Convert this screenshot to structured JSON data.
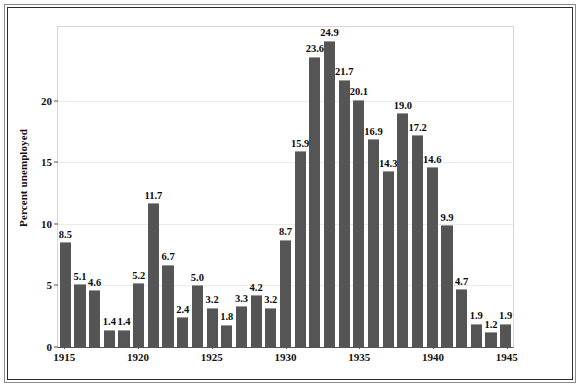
{
  "chart_data": {
    "type": "bar",
    "title": "",
    "subtitle": "",
    "xlabel": "",
    "ylabel": "Percent unemployed",
    "ylim": [
      0,
      26
    ],
    "yticks": [
      0,
      5,
      10,
      15,
      20
    ],
    "ytick_labels": [
      "0",
      "5",
      "10",
      "15",
      "20"
    ],
    "xticks": [
      1915,
      1920,
      1925,
      1930,
      1935,
      1940,
      1945
    ],
    "xtick_labels": [
      "1915",
      "1920",
      "1925",
      "1930",
      "1935",
      "1940",
      "1945"
    ],
    "grid": true,
    "grid_axis": "y",
    "legend": false,
    "legend_position": "none",
    "bar_color": "#555555",
    "data_labels": true,
    "categories": [
      "1915",
      "1916",
      "1917",
      "1918",
      "1919",
      "1920",
      "1921",
      "1922",
      "1923",
      "1924",
      "1925",
      "1926",
      "1927",
      "1928",
      "1929",
      "1930",
      "1931",
      "1932",
      "1933",
      "1934",
      "1935",
      "1936",
      "1937",
      "1938",
      "1939",
      "1940",
      "1941",
      "1942",
      "1943",
      "1944",
      "1945"
    ],
    "values": [
      8.5,
      5.1,
      4.6,
      1.4,
      1.4,
      5.2,
      11.7,
      6.7,
      2.4,
      5.0,
      3.2,
      1.8,
      3.3,
      4.2,
      3.2,
      8.7,
      15.9,
      23.6,
      24.9,
      21.7,
      20.1,
      16.9,
      14.3,
      19.0,
      17.2,
      14.6,
      9.9,
      4.7,
      1.9,
      1.2,
      1.9
    ],
    "value_labels": [
      "8.5",
      "5.1",
      "4.6",
      "1.4",
      "1.4",
      "5.2",
      "11.7",
      "6.7",
      "2.4",
      "5.0",
      "3.2",
      "1.8",
      "3.3",
      "4.2",
      "3.2",
      "8.7",
      "15.9",
      "23.6",
      "24.9",
      "21.7",
      "20.1",
      "16.9",
      "14.3",
      "19.0",
      "17.2",
      "14.6",
      "9.9",
      "4.7",
      "1.9",
      "1.2",
      "1.9"
    ]
  }
}
